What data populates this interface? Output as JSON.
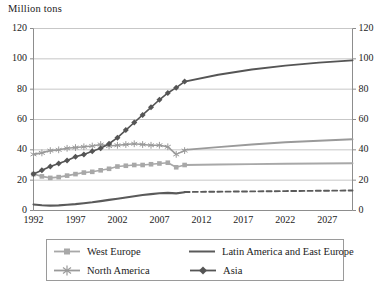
{
  "chart_data": {
    "type": "line",
    "title": "Million tons",
    "xlabel": "",
    "ylabel": "Million tons",
    "ylim": [
      0,
      120
    ],
    "ytick_values": [
      0,
      20,
      40,
      60,
      80,
      100,
      120
    ],
    "ytick_labels_left": [
      "0",
      "20",
      "40",
      "60",
      "80",
      "100",
      "120"
    ],
    "ytick_labels_right": [
      "0",
      "20",
      "40",
      "60",
      "80",
      "100",
      "120"
    ],
    "xlim": [
      1992,
      2030
    ],
    "xtick_labels": [
      "1992",
      "1997",
      "2002",
      "2007",
      "2012",
      "2017",
      "2022",
      "2027"
    ],
    "xtick_values": [
      1992,
      1997,
      2002,
      2007,
      2012,
      2017,
      2022,
      2027
    ],
    "grid": "horizontal",
    "legend_position": "bottom",
    "history_end_year": 2010,
    "series": [
      {
        "name": "West Europe",
        "color": "#a8a8a8",
        "marker": "square",
        "history_style": "solid",
        "forecast_style": "solid",
        "x": [
          1992,
          1993,
          1994,
          1995,
          1996,
          1997,
          1998,
          1999,
          2000,
          2001,
          2002,
          2003,
          2004,
          2005,
          2006,
          2007,
          2008,
          2009,
          2010
        ],
        "values": [
          24.0,
          22.5,
          21.5,
          22.0,
          23.0,
          24.0,
          25.0,
          25.5,
          26.5,
          27.5,
          29.0,
          29.5,
          30.0,
          30.0,
          30.5,
          31.0,
          31.5,
          28.5,
          30.0
        ],
        "forecast_x": [
          2010,
          2014,
          2018,
          2022,
          2026,
          2030
        ],
        "forecast_values": [
          30.0,
          30.3,
          30.6,
          30.8,
          31.0,
          31.2
        ]
      },
      {
        "name": "North America",
        "color": "#9a9a9a",
        "marker": "asterisk",
        "history_style": "solid",
        "forecast_style": "solid",
        "x": [
          1992,
          1993,
          1994,
          1995,
          1996,
          1997,
          1998,
          1999,
          2000,
          2001,
          2002,
          2003,
          2004,
          2005,
          2006,
          2007,
          2008,
          2009,
          2010
        ],
        "values": [
          37.0,
          38.0,
          39.5,
          40.0,
          41.0,
          41.5,
          42.0,
          42.5,
          43.5,
          42.5,
          43.0,
          43.5,
          44.0,
          43.5,
          43.0,
          43.0,
          42.0,
          37.0,
          39.5
        ],
        "forecast_x": [
          2010,
          2014,
          2018,
          2022,
          2026,
          2030
        ],
        "forecast_values": [
          40.0,
          41.8,
          43.5,
          45.0,
          46.0,
          47.0
        ]
      },
      {
        "name": "Latin America and East Europe",
        "color": "#5a5a5a",
        "marker": "none",
        "history_style": "solid",
        "forecast_style": "dashed",
        "x": [
          1992,
          1993,
          1994,
          1995,
          1996,
          1997,
          1998,
          1999,
          2000,
          2001,
          2002,
          2003,
          2004,
          2005,
          2006,
          2007,
          2008,
          2009,
          2010
        ],
        "values": [
          4.0,
          3.5,
          3.2,
          3.4,
          3.8,
          4.2,
          4.8,
          5.4,
          6.2,
          7.0,
          7.8,
          8.6,
          9.4,
          10.2,
          10.8,
          11.4,
          11.6,
          11.3,
          12.0
        ],
        "forecast_x": [
          2010,
          2014,
          2018,
          2022,
          2026,
          2030
        ],
        "forecast_values": [
          12.2,
          12.4,
          12.6,
          12.8,
          13.0,
          13.2
        ]
      },
      {
        "name": "Asia",
        "color": "#555555",
        "marker": "diamond",
        "history_style": "solid",
        "forecast_style": "solid",
        "x": [
          1992,
          1993,
          1994,
          1995,
          1996,
          1997,
          1998,
          1999,
          2000,
          2001,
          2002,
          2003,
          2004,
          2005,
          2006,
          2007,
          2008,
          2009,
          2010
        ],
        "values": [
          24.0,
          26.5,
          29.0,
          31.0,
          33.0,
          35.5,
          37.0,
          39.0,
          41.0,
          44.0,
          48.0,
          53.0,
          58.0,
          63.0,
          68.0,
          73.0,
          77.5,
          81.0,
          85.0
        ],
        "forecast_x": [
          2010,
          2014,
          2018,
          2022,
          2026,
          2030
        ],
        "forecast_values": [
          85.0,
          89.5,
          93.0,
          95.5,
          97.5,
          99.0
        ]
      }
    ]
  },
  "legend": {
    "entries": [
      {
        "label": "West Europe"
      },
      {
        "label": "Latin America and East Europe"
      },
      {
        "label": "North America"
      },
      {
        "label": "Asia"
      }
    ]
  }
}
